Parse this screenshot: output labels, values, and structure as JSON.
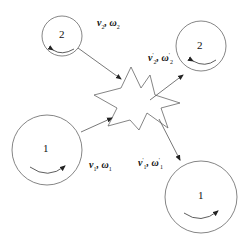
{
  "diagram": {
    "type": "collision-diagram",
    "background": "#ffffff",
    "stroke_color": "#555555",
    "nodes": [
      {
        "id": "ball-2-before",
        "label": "2",
        "cx": 62,
        "cy": 36,
        "r": 20
      },
      {
        "id": "ball-2-after",
        "label": "2",
        "cx": 201,
        "cy": 46,
        "r": 25
      },
      {
        "id": "ball-1-before",
        "label": "1",
        "cx": 47,
        "cy": 150,
        "r": 35
      },
      {
        "id": "ball-1-after",
        "label": "1",
        "cx": 201,
        "cy": 197,
        "r": 36
      },
      {
        "id": "collision",
        "label": "",
        "shape": "star"
      }
    ],
    "edges": [
      {
        "from": "ball-2-before",
        "to": "collision"
      },
      {
        "from": "collision",
        "to": "ball-2-after"
      },
      {
        "from": "ball-1-before",
        "to": "collision"
      },
      {
        "from": "collision",
        "to": "ball-1-after"
      }
    ],
    "labels": {
      "ball2_before": {
        "v": "v",
        "v_sub": "2",
        "sep": ", ",
        "w": "ω",
        "w_sub": "2"
      },
      "ball2_after": {
        "v": "v",
        "v_sup": "'",
        "v_sub": "2",
        "sep": ", ",
        "w": "ω",
        "w_sup": "'",
        "w_sub": "2"
      },
      "ball1_before": {
        "v": "v",
        "v_sub": "1",
        "sep": ", ",
        "w": "ω",
        "w_sub": "1"
      },
      "ball1_after": {
        "v": "v",
        "v_sup": "'",
        "v_sub": "1",
        "sep": ", ",
        "w": "ω",
        "w_sup": "'",
        "w_sub": "1"
      }
    },
    "circle_labels": {
      "ball2_before": "2",
      "ball2_after": "2",
      "ball1_before": "1",
      "ball1_after": "1"
    }
  }
}
